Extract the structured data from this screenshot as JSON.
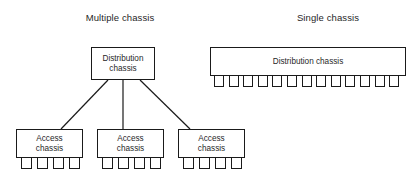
{
  "diagram": {
    "sections": [
      {
        "id": "multiple",
        "title": "Multiple chassis"
      },
      {
        "id": "single",
        "title": "Single chassis"
      }
    ],
    "multiple_chassis": {
      "distribution": {
        "label": "Distribution\nchassis",
        "line1": "Distribution",
        "line2": "chassis"
      },
      "access": [
        {
          "label": "Access\nchassis",
          "line1": "Access",
          "line2": "chassis",
          "port_count": 4
        },
        {
          "label": "Access\nchassis",
          "line1": "Access",
          "line2": "chassis",
          "port_count": 4
        },
        {
          "label": "Access\nchassis",
          "line1": "Access",
          "line2": "chassis",
          "port_count": 4
        }
      ],
      "links": [
        {
          "from": "distribution",
          "to": "access-1"
        },
        {
          "from": "distribution",
          "to": "access-2"
        },
        {
          "from": "distribution",
          "to": "access-3"
        }
      ]
    },
    "single_chassis": {
      "distribution": {
        "label": "Distribution chassis",
        "port_count": 13
      }
    },
    "colors": {
      "stroke": "#1a1a1a",
      "fill": "#ffffff",
      "text": "#1f1f1f",
      "background": "#ffffff"
    }
  }
}
